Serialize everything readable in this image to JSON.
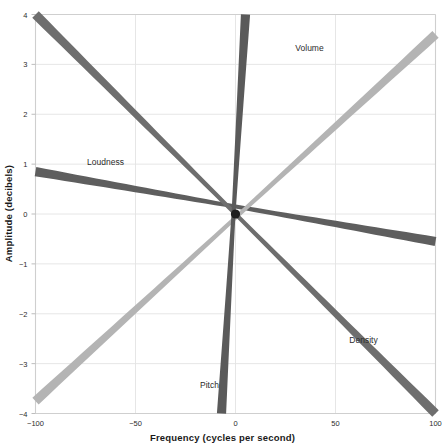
{
  "chart_data": {
    "type": "line",
    "title": "",
    "xlabel": "Frequency (cycles per second)",
    "ylabel": "Amplitude (decibels)",
    "xlim": [
      -100,
      100
    ],
    "ylim": [
      -4,
      4
    ],
    "xticks": [
      -100,
      -50,
      0,
      50,
      100
    ],
    "xticklabels": [
      "−100",
      "−50",
      "0",
      "50",
      "100"
    ],
    "yticks": [
      -4,
      -3,
      -2,
      -1,
      0,
      1,
      2,
      3,
      4
    ],
    "yticklabels": [
      "−4",
      "−3",
      "−2",
      "−1",
      "0",
      "1",
      "2",
      "3",
      "4"
    ],
    "grid": true,
    "legend": "inline-annotations",
    "series": [
      {
        "name": "Loudness",
        "color": "#5e5e5e",
        "x": [
          -100,
          0,
          100
        ],
        "y": [
          0.85,
          0.0,
          -0.55
        ],
        "label_x": -65,
        "label_y": 1.05
      },
      {
        "name": "Volume",
        "color": "#b4b4b4",
        "x": [
          -100,
          0,
          100
        ],
        "y": [
          -3.75,
          0.0,
          3.6
        ],
        "label_x": 37,
        "label_y": 3.32
      },
      {
        "name": "Density",
        "color": "#6e6e6e",
        "x": [
          -100,
          0,
          100
        ],
        "y": [
          4.0,
          0.0,
          -4.0
        ],
        "label_x": 64,
        "label_y": -2.52
      },
      {
        "name": "Pitch",
        "color": "#5a5a5a",
        "x": [
          -7,
          0,
          5
        ],
        "y": [
          -4.0,
          0.0,
          4.0
        ],
        "label_x": -13,
        "label_y": -3.42
      }
    ]
  },
  "axes": {
    "spine_color": "#cfcfcf",
    "grid_color": "#e3e3e3",
    "tick_color": "#bdbdbd",
    "background": "#ffffff"
  }
}
